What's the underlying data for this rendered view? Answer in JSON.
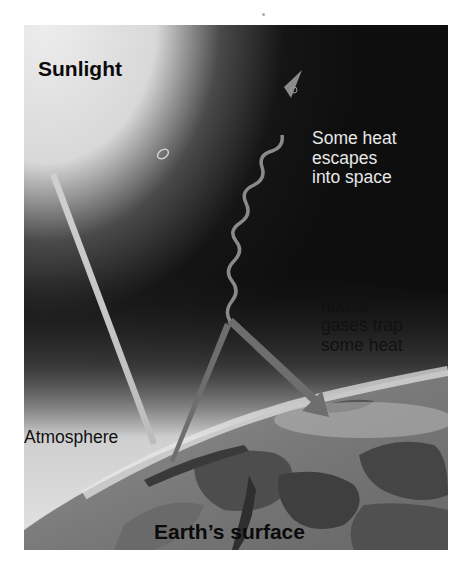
{
  "figure": {
    "labels": {
      "sunlight": "Sunlight",
      "escape": "Some heat\nescapes\ninto space",
      "trap": "Green-\nhouse\ngases trap\nsome heat",
      "atmosphere": "Atmosphere",
      "surface": "Earth’s surface"
    },
    "elements": [
      {
        "id": "sunlight-ray",
        "kind": "beam",
        "from": "upper-left sky",
        "to": "atmosphere boundary",
        "color": "#c8c8c8"
      },
      {
        "id": "reflected-heat",
        "kind": "arrow",
        "from": "earth surface",
        "to": "atmosphere",
        "color": "#6e6e6e"
      },
      {
        "id": "escaping-heat",
        "kind": "wavy-arrow",
        "from": "atmosphere",
        "to": "space",
        "color": "#8a8a8a"
      },
      {
        "id": "trapped-heat",
        "kind": "arrow",
        "from": "atmosphere",
        "to": "earth surface",
        "color": "#6e6e6e"
      }
    ],
    "colors": {
      "space": "#0d0d0d",
      "sky_glow": "#e6e6e6",
      "atmosphere": "#e2e2e2",
      "land": "#5a5a5a",
      "arrow": "#6e6e6e"
    }
  }
}
